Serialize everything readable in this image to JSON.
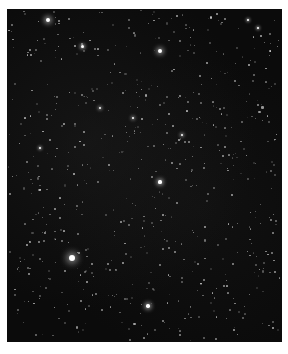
{
  "image": {
    "description": "Night-sky starfield photograph with white border",
    "background_color": "#0b0b0b",
    "border_color": "#ffffff",
    "bright_stars": [
      {
        "x": 48,
        "y": 20,
        "r": 2.2
      },
      {
        "x": 160,
        "y": 51,
        "r": 2.0
      },
      {
        "x": 72,
        "y": 258,
        "r": 3.0
      },
      {
        "x": 148,
        "y": 306,
        "r": 1.8
      },
      {
        "x": 82,
        "y": 46,
        "r": 1.5
      },
      {
        "x": 160,
        "y": 182,
        "r": 1.6
      },
      {
        "x": 100,
        "y": 108,
        "r": 1.4
      },
      {
        "x": 133,
        "y": 118,
        "r": 1.4
      },
      {
        "x": 182,
        "y": 135,
        "r": 1.4
      },
      {
        "x": 40,
        "y": 148,
        "r": 1.2
      },
      {
        "x": 248,
        "y": 20,
        "r": 1.2
      },
      {
        "x": 258,
        "y": 28,
        "r": 1.2
      }
    ]
  }
}
